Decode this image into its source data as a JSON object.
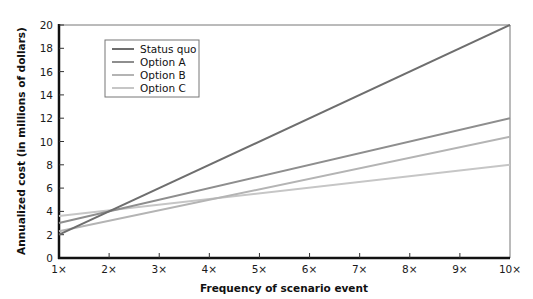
{
  "chart_data": {
    "type": "line",
    "title": "",
    "xlabel": "Frequency of scenario event",
    "ylabel": "Annualized cost (in millions of dollars)",
    "x": [
      1,
      10
    ],
    "x_tick_labels": [
      "1×",
      "2×",
      "3×",
      "4×",
      "5×",
      "6×",
      "7×",
      "8×",
      "9×",
      "10×"
    ],
    "y_tick_labels": [
      "0",
      "2",
      "4",
      "6",
      "8",
      "10",
      "12",
      "14",
      "16",
      "18",
      "20"
    ],
    "xlim": [
      1,
      10
    ],
    "ylim": [
      0,
      20
    ],
    "grid": false,
    "legend_position": "upper-left (inside plot)",
    "series": [
      {
        "name": "Status quo",
        "color": "#6e6e6e",
        "values": [
          2.0,
          20.0
        ]
      },
      {
        "name": "Option A",
        "color": "#8e8e8e",
        "values": [
          3.0,
          12.0
        ]
      },
      {
        "name": "Option B",
        "color": "#b4b4b4",
        "values": [
          2.3,
          10.4
        ]
      },
      {
        "name": "Option C",
        "color": "#c6c6c6",
        "values": [
          3.6,
          8.0
        ]
      }
    ]
  }
}
